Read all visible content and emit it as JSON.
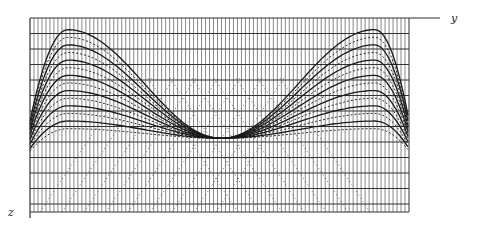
{
  "diagram": {
    "type": "wavefront-grid",
    "axes": {
      "horizontal_label": "y",
      "vertical_label": "z"
    },
    "grid": {
      "vertical_line_count": 95,
      "horizontal_line_count": 13,
      "line_color": "#555555"
    },
    "curves": {
      "description": "Family of symmetric bell-shaped curves with two peaks near left and right edges and a common trough at center",
      "count": 14,
      "peak_positions_fraction": [
        0.1,
        0.91
      ],
      "trough_position_fraction": 0.5,
      "trough_depth_fraction": 0.62,
      "curve_color": "#1a1a1a"
    }
  }
}
